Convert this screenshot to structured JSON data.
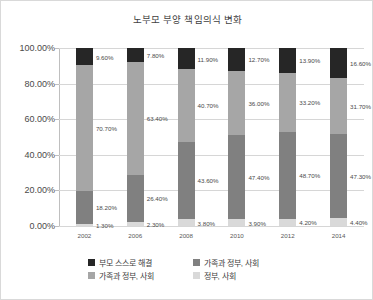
{
  "chart_data": {
    "type": "bar",
    "subtype": "stacked-percent",
    "title": "노부모 부양 책임의식 변화",
    "xlabel": "",
    "ylabel": "",
    "ylim": [
      0,
      100
    ],
    "ytick_labels": [
      "0.00%",
      "20.00%",
      "40.00%",
      "60.00%",
      "80.00%",
      "100.00%"
    ],
    "ytick_values": [
      0,
      20,
      40,
      60,
      80,
      100
    ],
    "grid": true,
    "legend_position": "bottom",
    "categories": [
      "2002",
      "2006",
      "2008",
      "2010",
      "2012",
      "2014"
    ],
    "series": [
      {
        "name": "정부, 사회",
        "color": "#d9d9d9",
        "values": [
          1.3,
          2.3,
          3.8,
          3.9,
          4.2,
          4.4
        ],
        "labels": [
          "1.30%",
          "2.30%",
          "3.80%",
          "3.90%",
          "4.20%",
          "4.40%"
        ]
      },
      {
        "name": "가족과 정부, 사회",
        "color": "#808080",
        "values": [
          18.2,
          26.4,
          43.6,
          47.4,
          48.7,
          47.3
        ],
        "labels": [
          "18.20%",
          "26.40%",
          "43.60%",
          "47.40%",
          "48.70%",
          "47.30%"
        ]
      },
      {
        "name": "가족과 정부, 사회",
        "color": "#a6a6a6",
        "values": [
          70.7,
          63.4,
          40.7,
          36.0,
          33.2,
          31.7
        ],
        "labels": [
          "70.70%",
          "63.40%",
          "40.70%",
          "36.00%",
          "33.20%",
          "31.70%"
        ]
      },
      {
        "name": "부모 스스로 해결",
        "color": "#262626",
        "values": [
          9.6,
          7.8,
          11.9,
          12.7,
          13.9,
          16.6
        ],
        "labels": [
          "9.60%",
          "7.80%",
          "11.90%",
          "12.70%",
          "13.90%",
          "16.60%"
        ]
      }
    ]
  },
  "title": "노부모 부양 책임의식 변화",
  "axis": {
    "y_labels": [
      "100.00%",
      "80.00%",
      "60.00%",
      "40.00%",
      "20.00%",
      "0.00%"
    ],
    "x_labels": [
      "2002",
      "2006",
      "2008",
      "2010",
      "2012",
      "2014"
    ]
  },
  "legend": {
    "items": [
      {
        "label": "부모 스스로 해결",
        "color": "#262626"
      },
      {
        "label": "가족과 정부, 사회",
        "color": "#808080"
      },
      {
        "label": "가족과 정부, 사회",
        "color": "#a6a6a6"
      },
      {
        "label": "정부, 사회",
        "color": "#d9d9d9"
      }
    ]
  }
}
